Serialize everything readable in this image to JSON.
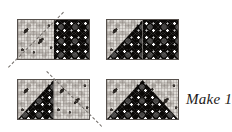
{
  "figure": {
    "kind": "quilting-piecing-diagram",
    "background_color": "#ffffff",
    "fabrics": {
      "light": {
        "name": "light-floral-print",
        "color": "#dedbd6"
      },
      "dark": {
        "name": "dark-star-print",
        "color": "#0b0907"
      }
    },
    "sewing_line": {
      "name": "dashed-stitching-line",
      "style": "dashed",
      "color": "#6f6a66"
    }
  },
  "steps": [
    {
      "id": "step-1",
      "label": "light square and dark rectangle with marked diagonal",
      "left_half": "light",
      "right_half": "dark",
      "sew_line": "bottom-left-to-top-right"
    },
    {
      "id": "step-2",
      "label": "left corner trimmed and pressed open",
      "left_half": "light-with-dark-triangle-lower-right",
      "right_half": "dark",
      "sew_line": "none"
    },
    {
      "id": "step-3",
      "label": "second light square added with marked diagonal",
      "left_half": "light-with-dark-triangle-lower-right",
      "right_half": "light",
      "sew_line": "top-left-to-bottom-right"
    },
    {
      "id": "step-4",
      "label": "completed flying geese unit",
      "left_half": "light-with-dark-peak",
      "right_half": "light-with-dark-peak",
      "sew_line": "none"
    }
  ],
  "caption": {
    "text": "Make 1"
  }
}
